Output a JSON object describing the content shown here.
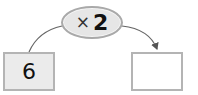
{
  "operation": {
    "symbol": "×",
    "operand": "2"
  },
  "input_box": {
    "value": "6"
  },
  "output_box": {
    "value": ""
  },
  "colors": {
    "box_border": "#b4b4b4",
    "input_fill": "#ebebeb",
    "oval_fill": "#e6e6e6",
    "line": "#555555"
  }
}
